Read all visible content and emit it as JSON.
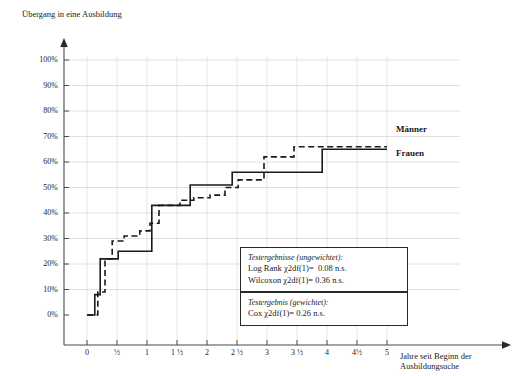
{
  "chart_data": {
    "type": "line",
    "title": "Übergang in eine Ausbildung",
    "xlabel": "Jahre seit Beginn der Ausbildungsuche",
    "ylabel": "Übergang in eine Ausbildung",
    "xlim": [
      0,
      5
    ],
    "ylim": [
      0,
      100
    ],
    "grid": true,
    "legend_position": "right-inline",
    "y_ticks": [
      "0%",
      "10%",
      "20%",
      "30%",
      "40%",
      "50%",
      "60%",
      "70%",
      "80%",
      "90%",
      "100%"
    ],
    "y_tick_values": [
      0,
      10,
      20,
      30,
      40,
      50,
      60,
      70,
      80,
      90,
      100
    ],
    "x_ticks": [
      "0",
      "½",
      "1",
      "1 ½",
      "2",
      "2 ½",
      "3",
      "3 ½",
      "4",
      "4½",
      "5"
    ],
    "x_tick_values": [
      0,
      0.5,
      1,
      1.5,
      2,
      2.5,
      3,
      3.5,
      4,
      4.5,
      5
    ],
    "series": [
      {
        "name": "Männer",
        "style": "dashed",
        "color": "#1a1a1a",
        "points": [
          [
            0.0,
            0
          ],
          [
            0.18,
            0
          ],
          [
            0.18,
            9
          ],
          [
            0.3,
            9
          ],
          [
            0.3,
            22
          ],
          [
            0.42,
            22
          ],
          [
            0.42,
            29
          ],
          [
            0.62,
            29
          ],
          [
            0.62,
            31
          ],
          [
            0.88,
            31
          ],
          [
            0.88,
            33
          ],
          [
            1.05,
            33
          ],
          [
            1.05,
            36
          ],
          [
            1.2,
            36
          ],
          [
            1.2,
            43
          ],
          [
            1.55,
            43
          ],
          [
            1.55,
            45
          ],
          [
            1.78,
            45
          ],
          [
            1.78,
            46
          ],
          [
            2.05,
            46
          ],
          [
            2.05,
            47
          ],
          [
            2.3,
            47
          ],
          [
            2.3,
            50
          ],
          [
            2.52,
            50
          ],
          [
            2.52,
            53
          ],
          [
            2.95,
            53
          ],
          [
            2.95,
            62
          ],
          [
            3.45,
            62
          ],
          [
            3.45,
            66
          ],
          [
            5.0,
            66
          ]
        ]
      },
      {
        "name": "Frauen",
        "style": "solid",
        "color": "#1a1a1a",
        "points": [
          [
            0.0,
            0
          ],
          [
            0.13,
            0
          ],
          [
            0.13,
            8
          ],
          [
            0.22,
            8
          ],
          [
            0.22,
            22
          ],
          [
            0.52,
            22
          ],
          [
            0.52,
            25
          ],
          [
            1.08,
            25
          ],
          [
            1.08,
            43
          ],
          [
            1.72,
            43
          ],
          [
            1.72,
            51
          ],
          [
            2.42,
            51
          ],
          [
            2.42,
            56
          ],
          [
            3.92,
            56
          ],
          [
            3.92,
            65
          ],
          [
            5.0,
            65
          ]
        ]
      }
    ],
    "annotations": [
      {
        "name": "testergebnisse-ungewichtet",
        "header": "Testergebnisse (ungewichtet):",
        "lines": [
          "Log Rank χ2df(1)=  0.08 n.s.",
          "Wilcoxon χ2df(1)= 0.36 n.s."
        ]
      },
      {
        "name": "testergebnis-gewichtet",
        "header": "Testergebnis (gewichtet):",
        "lines": [
          "Cox χ2df(1)= 0.26 n.s."
        ]
      }
    ]
  }
}
